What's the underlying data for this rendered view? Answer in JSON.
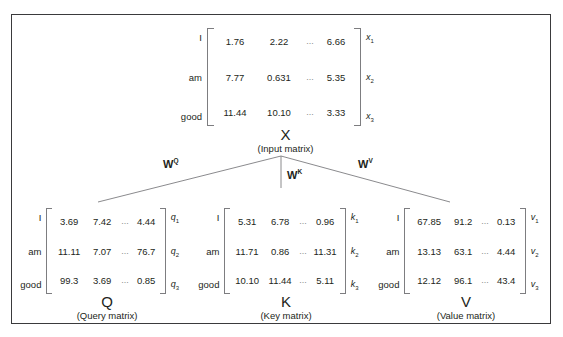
{
  "figure": {
    "background_color": "#ffffff",
    "frame_color": "#3a3a3c",
    "text_color": "#231f20",
    "bracket_color": "#7d7d80",
    "connector_color": "#7d7d80"
  },
  "matrices": {
    "x": {
      "name": "X",
      "description": "(Input matrix)",
      "row_labels": [
        "I",
        "am",
        "good"
      ],
      "col_labels": [
        "x1",
        "x2",
        "x3"
      ],
      "col_label_base": "x",
      "col_label_subs": [
        "1",
        "2",
        "3"
      ],
      "ellipsis": "...",
      "rows": [
        [
          "1.76",
          "2.22",
          "...",
          "6.66"
        ],
        [
          "7.77",
          "0.631",
          "...",
          "5.35"
        ],
        [
          "11.44",
          "10.10",
          "...",
          "3.33"
        ]
      ]
    },
    "q": {
      "name": "Q",
      "description": "(Query matrix)",
      "row_labels": [
        "I",
        "am",
        "good"
      ],
      "col_label_base": "q",
      "col_label_subs": [
        "1",
        "2",
        "3"
      ],
      "rows": [
        [
          "3.69",
          "7.42",
          "...",
          "4.44"
        ],
        [
          "11.11",
          "7.07",
          "...",
          "76.7"
        ],
        [
          "99.3",
          "3.69",
          "...",
          "0.85"
        ]
      ]
    },
    "k": {
      "name": "K",
      "description": "(Key matrix)",
      "row_labels": [
        "I",
        "am",
        "good"
      ],
      "col_label_base": "k",
      "col_label_subs": [
        "1",
        "2",
        "3"
      ],
      "rows": [
        [
          "5.31",
          "6.78",
          "...",
          "0.96"
        ],
        [
          "11.71",
          "0.86",
          "...",
          "11.31"
        ],
        [
          "10.10",
          "11.44",
          "...",
          "5.11"
        ]
      ]
    },
    "v": {
      "name": "V",
      "description": "(Value matrix)",
      "row_labels": [
        "I",
        "am",
        "good"
      ],
      "col_label_base": "v",
      "col_label_subs": [
        "1",
        "2",
        "3"
      ],
      "rows": [
        [
          "67.85",
          "91.2",
          "...",
          "0.13"
        ],
        [
          "13.13",
          "63.1",
          "...",
          "4.44"
        ],
        [
          "12.12",
          "96.1",
          "...",
          "43.4"
        ]
      ]
    }
  },
  "weights": {
    "wq": {
      "base": "W",
      "sup": "Q"
    },
    "wk": {
      "base": "W",
      "sup": "K"
    },
    "wv": {
      "base": "W",
      "sup": "V"
    }
  }
}
